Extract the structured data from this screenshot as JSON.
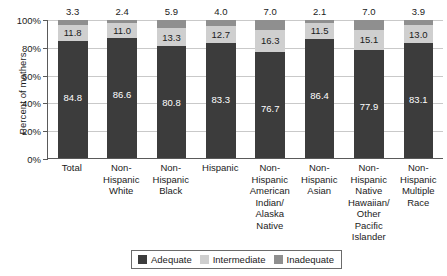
{
  "chart_data": {
    "type": "bar",
    "subtype": "stacked-100-percent",
    "title": "",
    "xlabel": "",
    "ylabel": "Percent of mothers",
    "ylim": [
      0,
      100
    ],
    "yticks": [
      "0%",
      "20%",
      "40%",
      "60%",
      "80%",
      "100%"
    ],
    "ytick_values": [
      0,
      20,
      40,
      60,
      80,
      100
    ],
    "grid": true,
    "legend_position": "bottom-center",
    "categories": [
      "Total",
      "Non-\nHispanic\nWhite",
      "Non-\nHispanic\nBlack",
      "Hispanic",
      "Non-\nHispanic\nAmerican\nIndian/\nAlaska Native",
      "Non-\nHispanic\nAsian",
      "Non-\nHispanic\nNative\nHawaiian/\nOther\nPacific Islander",
      "Non-\nHispanic\nMultiple\nRace"
    ],
    "series": [
      {
        "name": "Adequate",
        "color": "#3c3c3c",
        "values": [
          84.8,
          86.6,
          80.8,
          83.3,
          76.7,
          86.4,
          77.9,
          83.1
        ],
        "labels": [
          "84.8",
          "86.6",
          "80.8",
          "83.3",
          "76.7",
          "86.4",
          "77.9",
          "83.1"
        ]
      },
      {
        "name": "Intermediate",
        "color": "#cfcfcf",
        "values": [
          11.8,
          11.0,
          13.3,
          12.7,
          16.3,
          11.5,
          15.1,
          13.0
        ],
        "labels": [
          "11.8",
          "11.0",
          "13.3",
          "12.7",
          "16.3",
          "11.5",
          "15.1",
          "13.0"
        ]
      },
      {
        "name": "Inadequate",
        "color": "#8f8f8f",
        "values": [
          3.3,
          2.4,
          5.9,
          4.0,
          7.0,
          2.1,
          7.0,
          3.9
        ],
        "labels": [
          "3.3",
          "2.4",
          "5.9",
          "4.0",
          "7.0",
          "2.1",
          "7.0",
          "3.9"
        ],
        "labels_placed_above_bar": true
      }
    ]
  },
  "legend": {
    "items": [
      {
        "label": "Adequate",
        "color": "#3c3c3c"
      },
      {
        "label": "Intermediate",
        "color": "#cfcfcf"
      },
      {
        "label": "Inadequate",
        "color": "#8f8f8f"
      }
    ]
  },
  "colors": {
    "adequate": "#3c3c3c",
    "intermediate": "#cfcfcf",
    "inadequate": "#8f8f8f",
    "axis": "#5a5a5a",
    "grid": "#c9c9c9",
    "background": "#ffffff"
  }
}
